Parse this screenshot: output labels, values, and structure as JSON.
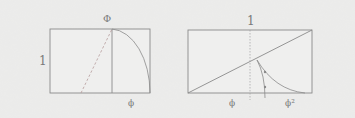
{
  "left_figure": {
    "top_label": "Φ",
    "side_label": "1",
    "bottom_label": "ϕ"
  },
  "right_figure": {
    "top_label": "1",
    "bottom_left_label": "ϕ",
    "bottom_right_label": "ϕ²"
  },
  "colors": {
    "background": "#ebebea",
    "line": "#8a8a8a",
    "dashed": "#b59a9a"
  }
}
